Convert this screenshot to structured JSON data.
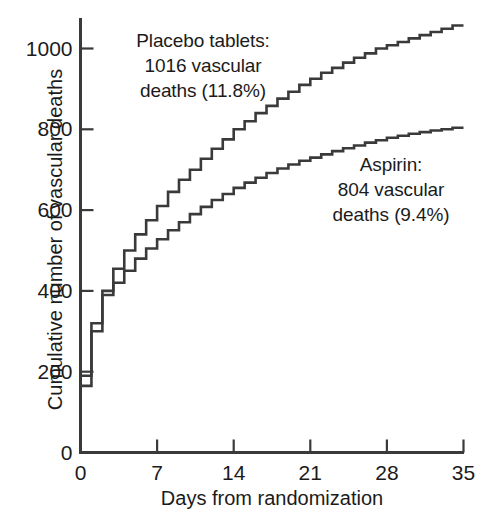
{
  "chart_data": {
    "type": "line",
    "subtype": "step",
    "title": "",
    "xlabel": "Days from randomization",
    "ylabel": "Cumulative number of vascular deaths",
    "xlim": [
      0,
      35
    ],
    "ylim": [
      0,
      1100
    ],
    "xticks": [
      0,
      7,
      14,
      21,
      28,
      35
    ],
    "xtick_labels": [
      "0",
      "7",
      "14",
      "21",
      "28",
      "35"
    ],
    "yticks": [
      0,
      200,
      400,
      600,
      800,
      1000
    ],
    "ytick_labels": [
      "0",
      "200",
      "400",
      "600",
      "800",
      "1000"
    ],
    "grid": false,
    "legend_position": "inline-annotations",
    "line_color": "#3a3a3a",
    "background_color": "#ffffff",
    "axis_color": "#3a3a3a",
    "x": [
      0,
      1,
      2,
      3,
      4,
      5,
      6,
      7,
      8,
      9,
      10,
      11,
      12,
      13,
      14,
      15,
      16,
      17,
      18,
      19,
      20,
      21,
      22,
      23,
      24,
      25,
      26,
      27,
      28,
      29,
      30,
      31,
      32,
      33,
      34,
      35
    ],
    "series": [
      {
        "name": "Placebo tablets",
        "label": "Placebo tablets: 1016 vascular deaths (11.8%)",
        "total_deaths": 1016,
        "percent": "11.8%",
        "values": [
          0,
          190,
          320,
          400,
          455,
          500,
          540,
          575,
          610,
          645,
          675,
          700,
          727,
          752,
          775,
          800,
          820,
          840,
          858,
          876,
          893,
          910,
          925,
          940,
          952,
          965,
          977,
          988,
          1000,
          1008,
          1016,
          1025,
          1033,
          1041,
          1049,
          1057
        ]
      },
      {
        "name": "Aspirin",
        "label": "Aspirin: 804 vascular deaths (9.4%)",
        "total_deaths": 804,
        "percent": "9.4%",
        "values": [
          0,
          165,
          300,
          390,
          420,
          450,
          480,
          505,
          528,
          550,
          570,
          590,
          608,
          625,
          640,
          655,
          668,
          680,
          692,
          703,
          713,
          722,
          730,
          738,
          746,
          753,
          760,
          767,
          773,
          779,
          784,
          789,
          793,
          797,
          800,
          804
        ]
      }
    ]
  },
  "annotations": {
    "placebo": {
      "line1": "Placebo tablets:",
      "line2": "1016 vascular",
      "line3": "deaths (11.8%)"
    },
    "aspirin": {
      "line1": "Aspirin:",
      "line2": "804 vascular",
      "line3": "deaths (9.4%)"
    }
  },
  "axes": {
    "x_title": "Days from randomization",
    "y_title": "Cumulative number of vascular deaths",
    "x_tick_labels": [
      "0",
      "7",
      "14",
      "21",
      "28",
      "35"
    ],
    "y_tick_labels": [
      "0",
      "200",
      "400",
      "600",
      "800",
      "1000"
    ]
  }
}
